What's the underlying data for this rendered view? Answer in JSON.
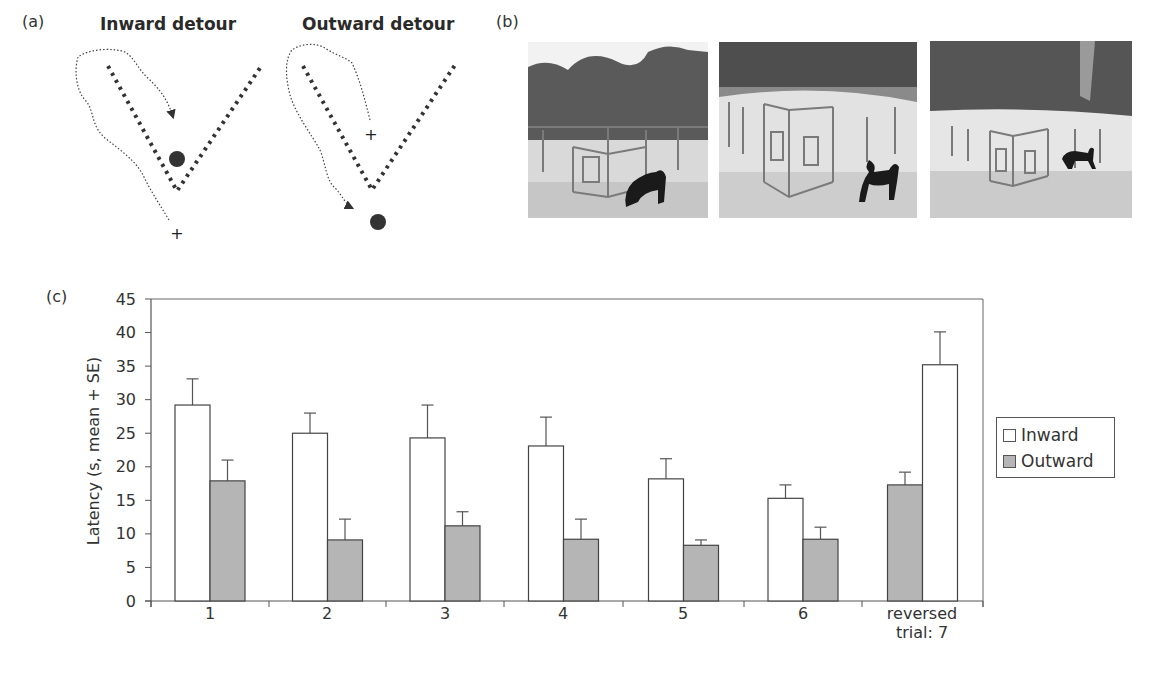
{
  "panel_a": {
    "label": "(a)",
    "diagrams": [
      {
        "title": "Inward detour",
        "start_marker": "+",
        "goal_marker": "food-dot"
      },
      {
        "title": "Outward detour",
        "start_marker": "+",
        "goal_marker": "food-dot"
      }
    ]
  },
  "panel_b": {
    "label": "(b)",
    "photos": [
      {
        "description": "Dog at the V-shaped fence corner, sniffing inside"
      },
      {
        "description": "Dog walking beside the V-shaped fence"
      },
      {
        "description": "Dog walking around the V-shaped fence at a distance"
      }
    ]
  },
  "panel_c": {
    "label": "(c)",
    "legend": {
      "inward": "Inward",
      "outward": "Outward"
    },
    "x_labels": [
      "1",
      "2",
      "3",
      "4",
      "5",
      "6",
      "reversed",
      "trial: 7"
    ]
  },
  "chart_data": {
    "type": "bar",
    "title": "",
    "xlabel": "trial",
    "ylabel": "Latency (s, mean + SE)",
    "ylim": [
      0,
      45
    ],
    "yticks": [
      0,
      5,
      10,
      15,
      20,
      25,
      30,
      35,
      40,
      45
    ],
    "categories": [
      "1",
      "2",
      "3",
      "4",
      "5",
      "6",
      "reversed trial: 7"
    ],
    "grid": false,
    "legend_position": "right",
    "series": [
      {
        "name": "Inward",
        "color": "#ffffff",
        "values": [
          29.2,
          25.0,
          24.3,
          23.1,
          18.2,
          15.3,
          35.2
        ],
        "error_upper": [
          33.1,
          28.0,
          29.2,
          27.4,
          21.2,
          17.3,
          40.1
        ]
      },
      {
        "name": "Outward",
        "color": "#b5b5b5",
        "values": [
          17.9,
          9.1,
          11.2,
          9.2,
          8.3,
          9.2,
          17.3
        ],
        "error_upper": [
          21.0,
          12.2,
          13.3,
          12.2,
          9.1,
          11.0,
          19.2
        ]
      }
    ]
  }
}
